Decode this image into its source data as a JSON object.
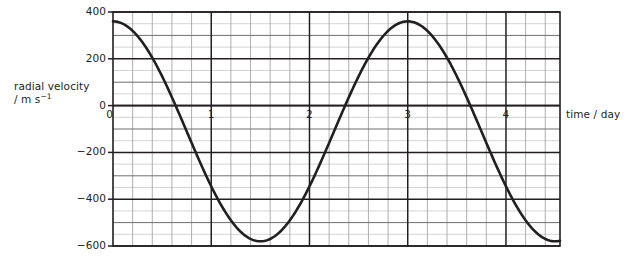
{
  "chart_data": {
    "type": "line",
    "title": "",
    "xlabel": "time / day",
    "ylabel_line1": "radial velocity",
    "ylabel_line2": "/ m s",
    "ylabel_exponent": "−1",
    "xlim": [
      0,
      4.55
    ],
    "ylim": [
      -600,
      400
    ],
    "x_major_ticks": [
      0,
      1,
      2,
      3,
      4
    ],
    "x_tick_labels": [
      "0",
      "1",
      "2",
      "3",
      "4"
    ],
    "x_minor_step": 0.2,
    "y_major_ticks": [
      400,
      200,
      0,
      -200,
      -400,
      -600
    ],
    "y_tick_labels": [
      "400",
      "200",
      "0",
      "−200",
      "−400",
      "−600"
    ],
    "y_mid_step": 100,
    "y_minor_step": 50,
    "grid": true,
    "legend": "none",
    "curve": {
      "name": "radial velocity",
      "form": "sinusoid",
      "amplitude": 470,
      "offset": -110,
      "period_days": 3.0,
      "phase_days": 0.0,
      "color": "#231f20",
      "line_width": 2.6,
      "maximum_value": 360,
      "minimum_value": -580,
      "zero_crossings_days": [
        0.75,
        2.6,
        3.75
      ],
      "points": [
        {
          "x": 0.0,
          "y": 360
        },
        {
          "x": 0.2,
          "y": 310
        },
        {
          "x": 0.4,
          "y": 205
        },
        {
          "x": 0.6,
          "y": 70
        },
        {
          "x": 0.75,
          "y": 0
        },
        {
          "x": 0.8,
          "y": -70
        },
        {
          "x": 1.0,
          "y": -230
        },
        {
          "x": 1.2,
          "y": -370
        },
        {
          "x": 1.4,
          "y": -480
        },
        {
          "x": 1.6,
          "y": -550
        },
        {
          "x": 1.8,
          "y": -580
        },
        {
          "x": 2.0,
          "y": -565
        },
        {
          "x": 2.2,
          "y": -500
        },
        {
          "x": 2.4,
          "y": -390
        },
        {
          "x": 2.6,
          "y": -240
        },
        {
          "x": 2.75,
          "y": -110
        },
        {
          "x": 2.9,
          "y": 30
        },
        {
          "x": 3.1,
          "y": 190
        },
        {
          "x": 3.3,
          "y": 300
        },
        {
          "x": 3.5,
          "y": 355
        },
        {
          "x": 3.62,
          "y": 360
        },
        {
          "x": 3.8,
          "y": 330
        },
        {
          "x": 4.0,
          "y": 240
        },
        {
          "x": 4.2,
          "y": 110
        },
        {
          "x": 4.4,
          "y": -60
        },
        {
          "x": 4.55,
          "y": -200
        },
        {
          "x": 4.8,
          "y": -350
        }
      ]
    }
  },
  "axes": {
    "plot_left_px": 113,
    "plot_right_px": 560,
    "plot_top_px": 12,
    "plot_bottom_px": 246
  }
}
